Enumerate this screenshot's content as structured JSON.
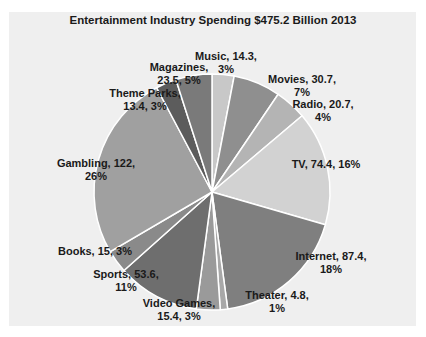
{
  "chart_data": {
    "type": "pie",
    "title": "Entertainment Industry Spending $475.2 Billion 2013",
    "total": 475.2,
    "units": "Billion $",
    "start_angle_deg": 0,
    "direction": "clockwise",
    "center": [
      212,
      192
    ],
    "radius": 118,
    "slices": [
      {
        "label": "Music",
        "value": 14.3,
        "percent": "3%",
        "color": "#c8c8c8",
        "label_lines": [
          "Music, 14.3,",
          "3%"
        ],
        "label_pos": [
          226,
          60
        ]
      },
      {
        "label": "Movies",
        "value": 30.7,
        "percent": "7%",
        "color": "#8f8f8f",
        "label_lines": [
          "Movies, 30.7,",
          "7%"
        ],
        "label_pos": [
          302,
          83
        ]
      },
      {
        "label": "Radio",
        "value": 20.7,
        "percent": "4%",
        "color": "#b4b4b4",
        "label_lines": [
          "Radio, 20.7,",
          "4%"
        ],
        "label_pos": [
          323,
          108
        ]
      },
      {
        "label": "TV",
        "value": 74.4,
        "percent": "16%",
        "color": "#d2d2d2",
        "label_lines": [
          "TV, 74.4, 16%"
        ],
        "label_pos": [
          326,
          168
        ]
      },
      {
        "label": "Internet",
        "value": 87.4,
        "percent": "18%",
        "color": "#7f7f7f",
        "label_lines": [
          "Internet, 87.4,",
          "18%"
        ],
        "label_pos": [
          331,
          260
        ]
      },
      {
        "label": "Theater",
        "value": 4.8,
        "percent": "1%",
        "color": "#a8a8a8",
        "label_lines": [
          "Theater, 4.8,",
          "1%"
        ],
        "label_pos": [
          277,
          299
        ]
      },
      {
        "label": "Video Games",
        "value": 15.4,
        "percent": "3%",
        "color": "#9a9a9a",
        "label_lines": [
          "Video Games,",
          "15.4, 3%"
        ],
        "label_pos": [
          179,
          307
        ]
      },
      {
        "label": "Sports",
        "value": 53.6,
        "percent": "11%",
        "color": "#6e6e6e",
        "label_lines": [
          "Sports, 53.6,",
          "11%"
        ],
        "label_pos": [
          126,
          278
        ]
      },
      {
        "label": "Books",
        "value": 15.0,
        "percent": "3%",
        "color": "#8a8a8a",
        "label_lines": [
          "Books, 15, 3%"
        ],
        "label_pos": [
          95,
          255
        ]
      },
      {
        "label": "Gambling",
        "value": 122.0,
        "percent": "26%",
        "color": "#a0a0a0",
        "label_lines": [
          "Gambling, 122,",
          "26%"
        ],
        "label_pos": [
          96,
          167
        ]
      },
      {
        "label": "Theme Parks",
        "value": 13.4,
        "percent": "3%",
        "color": "#5c5c5c",
        "label_lines": [
          "Theme Parks,",
          "13.4, 3%"
        ],
        "label_pos": [
          145,
          97
        ]
      },
      {
        "label": "Magazines",
        "value": 23.5,
        "percent": "5%",
        "color": "#7a7a7a",
        "label_lines": [
          "Magazines,",
          "23.5, 5%"
        ],
        "label_pos": [
          179,
          71
        ]
      }
    ],
    "legend": "none",
    "grid": false
  }
}
